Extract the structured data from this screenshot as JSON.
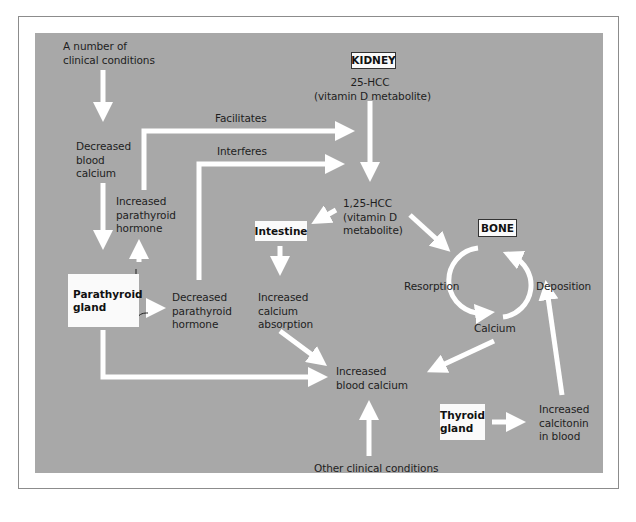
{
  "diagram": {
    "title_nodes": {
      "kidney": "KIDNEY",
      "bone": "BONE",
      "intestine": "Intestine",
      "parathyroid_gland": "Parathyroid\ngland",
      "thyroid_gland": "Thyroid\ngland"
    },
    "labels": {
      "clinical_conditions": "A number of\nclinical conditions",
      "decreased_blood_calcium": "Decreased\nblood\ncalcium",
      "increased_parathyroid_hormone": "Increased\nparathyroid\nhormone",
      "decreased_parathyroid_hormone": "Decreased\nparathyroid\nhormone",
      "facilitates": "Facilitates",
      "interferes": "Interferes",
      "hcc_25": "25-HCC\n(vitamin D metabolite)",
      "hcc_125": "1,25-HCC\n(vitamin D\nmetabolite)",
      "increased_calcium_absorption": "Increased\ncalcium\nabsorption",
      "resorption": "Resorption",
      "deposition": "Deposition",
      "calcium": "Calcium",
      "increased_blood_calcium": "Increased\nblood calcium",
      "increased_calcitonin": "Increased\ncalcitonin\nin blood",
      "other_clinical_conditions": "Other clinical conditions"
    },
    "colors": {
      "background_panel": "#a8a8a8",
      "arrow": "#ffffff",
      "node_box": "#fafafa",
      "text": "#1e1e1e"
    }
  }
}
